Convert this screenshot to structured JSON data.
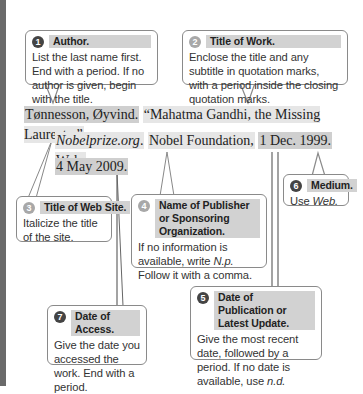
{
  "callouts": [
    {
      "number": "1",
      "title": "Author.",
      "body": "List the last name first. End with a period. If no author is given, begin with the title."
    },
    {
      "number": "2",
      "title": "Title of Work.",
      "body": "Enclose the title and any subtitle in quotation marks, with a period inside the closing quotation marks."
    },
    {
      "number": "3",
      "title": "Title of Web Site.",
      "body": "Italicize the title of the site."
    },
    {
      "number": "4",
      "title": "Name of Publisher or Sponsoring Organization.",
      "body_pre": "If no information is available, write ",
      "body_em": "N.p.",
      "body_post": " Follow it with a comma."
    },
    {
      "number": "5",
      "title": "Date of Publication or Latest Update.",
      "body_pre": "Give the most recent date, followed by a period. If no date is available, use ",
      "body_em": "n.d."
    },
    {
      "number": "6",
      "title": "Medium.",
      "body_pre": "Use ",
      "body_em": "Web."
    },
    {
      "number": "7",
      "title": "Date of Access.",
      "body": "Give the date you accessed the work. End with a period."
    }
  ],
  "citation": {
    "author": "Tønnesson, Øyvind.",
    "title": "“Mahatma Gandhi, the Missing Laureate.”",
    "site": "Nobelprize.org",
    "site_punct": ".",
    "publisher": "Nobel Foundation,",
    "pub_date": "1 Dec. 1999.",
    "medium": "Web.",
    "access_date": "4 May 2009."
  },
  "colors": {
    "highlight": "#cfcfcf",
    "highlight_light": "#e6e6e6",
    "number_dark": "#444444",
    "border": "#8a8a8a"
  }
}
